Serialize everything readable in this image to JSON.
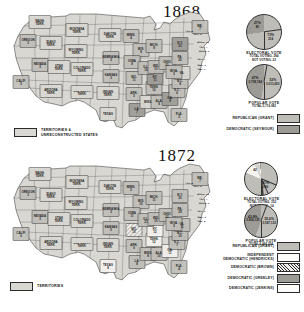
{
  "maps": [
    {
      "year": "1868",
      "territory_legend": {
        "label": "TERRITORIES &\nUNRECONSTRUCTED STATES",
        "swatch": "terr"
      },
      "pies": [
        {
          "caption": "ELECTORAL VOTE",
          "sub": "TOTAL VOTING- 294\nNOT VOTING- 23",
          "slices": [
            {
              "party": "republican",
              "pct": "73%",
              "value": "214",
              "share": 72.8,
              "fill": "rep"
            },
            {
              "party": "democratic",
              "pct": "27%",
              "value": "80",
              "share": 27.2,
              "fill": "dem"
            }
          ]
        },
        {
          "caption": "POPULAR VOTE",
          "sub": "TOTAL 5,716,082",
          "slices": [
            {
              "party": "republican",
              "pct": "53%",
              "value": "3,013,650",
              "share": 52.7,
              "fill": "rep"
            },
            {
              "party": "democratic",
              "pct": "47%",
              "value": "2,708,744",
              "share": 47.3,
              "fill": "dem"
            }
          ]
        }
      ],
      "legend": [
        {
          "label": "REPUBLICAN (GRANT)",
          "swatch": "rep"
        },
        {
          "label": "DEMOCRATIC (SEYMOUR)",
          "swatch": "dem"
        }
      ]
    },
    {
      "year": "1872",
      "territory_legend": {
        "label": "TERRITORIES",
        "swatch": "terr"
      },
      "pies": [
        {
          "caption": "ELECTORAL VOTE",
          "sub": "TOTAL VOTING- 352\nNOT VOTING- 14",
          "slices": [
            {
              "party": "republican",
              "pct": "81%",
              "value": "286",
              "share": 81.3,
              "fill": "rep"
            },
            {
              "party": "hendricks",
              "pct": "",
              "value": "42",
              "share": 11.9,
              "fill": "white"
            },
            {
              "party": "brown",
              "pct": "",
              "value": "18",
              "share": 5.1,
              "fill": "hatch"
            },
            {
              "party": "jenkins",
              "pct": "",
              "value": "2",
              "share": 0.9,
              "fill": "white"
            },
            {
              "party": "davis",
              "pct": "",
              "value": "1",
              "share": 0.8,
              "fill": "dem"
            }
          ]
        },
        {
          "caption": "POPULAR VOTE",
          "sub": "TOTAL 6,466,224",
          "slices": [
            {
              "party": "republican",
              "pct": "55.6%",
              "value": "3,597,132",
              "share": 55.6,
              "fill": "rep"
            },
            {
              "party": "democratic",
              "pct": "43.8%",
              "value": "2,834,125",
              "share": 44.4,
              "fill": "dem"
            }
          ]
        }
      ],
      "legend": [
        {
          "label": "REPUBLICAN (GRANT)",
          "swatch": "rep"
        },
        {
          "label": "INDEPENDENT\nDEMOCRATIC (HENDRICKS)",
          "swatch": "white"
        },
        {
          "label": "DEMOCRATIC (BROWN)",
          "swatch": "hatch"
        },
        {
          "label": "DEMOCRATIC (GREELEY)",
          "swatch": "dem"
        },
        {
          "label": "DEMOCRATIC (JENKINS)",
          "swatch": "white"
        }
      ]
    }
  ],
  "states_1868": [
    {
      "n": "WASH.\nTERR.",
      "x": 36,
      "y": 12,
      "f": "terr"
    },
    {
      "n": "OREGON",
      "e": "3",
      "x": 24,
      "y": 31,
      "f": "rep"
    },
    {
      "n": "IDAHO\nTERR.",
      "x": 47,
      "y": 33,
      "f": "terr"
    },
    {
      "n": "MONTANA\nTERR.",
      "x": 73,
      "y": 20,
      "f": "terr"
    },
    {
      "n": "DAKOTA\nTERR.",
      "x": 106,
      "y": 25,
      "f": "terr"
    },
    {
      "n": "WYOMING\nTERR.",
      "x": 72,
      "y": 41,
      "f": "terr"
    },
    {
      "n": "NEVADA",
      "e": "3",
      "x": 36,
      "y": 55,
      "f": "rep"
    },
    {
      "n": "UTAH\nTERR.",
      "x": 55,
      "y": 57,
      "f": "terr"
    },
    {
      "n": "COLORADO\nTERR.",
      "x": 78,
      "y": 59,
      "f": "terr"
    },
    {
      "n": "NEBRASKA",
      "e": "3",
      "x": 107,
      "y": 48,
      "f": "rep"
    },
    {
      "n": "CALIF.",
      "e": "5",
      "x": 17,
      "y": 72,
      "f": "rep"
    },
    {
      "n": "KANSAS",
      "e": "3",
      "x": 107,
      "y": 66,
      "f": "rep"
    },
    {
      "n": "ARIZONA\nTERR.",
      "x": 47,
      "y": 81,
      "f": "terr"
    },
    {
      "n": "NEW MEXICO\nTERR.",
      "x": 78,
      "y": 82,
      "f": "terr"
    },
    {
      "n": "INDIAN\nTERR.",
      "x": 104,
      "y": 83,
      "f": "terr"
    },
    {
      "n": "TEXAS",
      "x": 104,
      "y": 104,
      "f": "terr"
    },
    {
      "n": "MINN.",
      "e": "4",
      "x": 127,
      "y": 26,
      "f": "rep"
    },
    {
      "n": "WIS.",
      "e": "8",
      "x": 137,
      "y": 40,
      "f": "rep"
    },
    {
      "n": "IOWA",
      "e": "8",
      "x": 128,
      "y": 52,
      "f": "rep"
    },
    {
      "n": "MO.",
      "e": "11",
      "x": 130,
      "y": 68,
      "f": "rep"
    },
    {
      "n": "ARK.",
      "e": "5",
      "x": 130,
      "y": 84,
      "f": "rep"
    },
    {
      "n": "LA.",
      "e": "7",
      "x": 133,
      "y": 100,
      "f": "dem"
    },
    {
      "n": "MISS.",
      "x": 144,
      "y": 92,
      "f": "terr"
    },
    {
      "n": "ALA.",
      "e": "8",
      "x": 155,
      "y": 92,
      "f": "rep"
    },
    {
      "n": "TENN.",
      "e": "10",
      "x": 150,
      "y": 78,
      "f": "rep"
    },
    {
      "n": "KY.",
      "e": "11",
      "x": 151,
      "y": 68,
      "f": "dem"
    },
    {
      "n": "ILL.",
      "e": "16",
      "x": 142,
      "y": 58,
      "f": "rep"
    },
    {
      "n": "IND.",
      "e": "13",
      "x": 152,
      "y": 57,
      "f": "rep"
    },
    {
      "n": "OHIO",
      "e": "21",
      "x": 163,
      "y": 53,
      "f": "rep"
    },
    {
      "n": "MICH.",
      "e": "8",
      "x": 150,
      "y": 36,
      "f": "rep"
    },
    {
      "n": "GA.",
      "e": "9",
      "x": 166,
      "y": 89,
      "f": "dem"
    },
    {
      "n": "FLA.",
      "e": "3",
      "x": 175,
      "y": 105,
      "f": "rep"
    },
    {
      "n": "S.C.",
      "e": "6",
      "x": 173,
      "y": 81,
      "f": "rep"
    },
    {
      "n": "N.C.",
      "e": "9",
      "x": 176,
      "y": 72,
      "f": "rep"
    },
    {
      "n": "VA.",
      "x": 178,
      "y": 63,
      "f": "terr"
    },
    {
      "n": "W.VA.",
      "e": "5",
      "x": 170,
      "y": 62,
      "f": "rep"
    },
    {
      "n": "PA.",
      "e": "26",
      "x": 176,
      "y": 48,
      "f": "rep"
    },
    {
      "n": "N.Y.",
      "e": "33",
      "x": 176,
      "y": 34,
      "f": "dem"
    },
    {
      "n": "ME.",
      "e": "7",
      "x": 196,
      "y": 17,
      "f": "rep"
    }
  ],
  "small_states_1868": [
    {
      "n": "VT. 5",
      "x": 186,
      "y": 22
    },
    {
      "n": "N.H. 5",
      "x": 194,
      "y": 25
    },
    {
      "n": "MASS. 12",
      "x": 199,
      "y": 33
    },
    {
      "n": "R.I. 4",
      "x": 200,
      "y": 38
    },
    {
      "n": "CONN. 6",
      "x": 200,
      "y": 42
    },
    {
      "n": "N.J. 7",
      "x": 198,
      "y": 50
    },
    {
      "n": "DEL. 3",
      "x": 198,
      "y": 56
    },
    {
      "n": "MD. 7",
      "x": 198,
      "y": 60
    }
  ],
  "states_1872": [
    {
      "n": "WASH.\nTERR.",
      "x": 36,
      "y": 12,
      "f": "terr"
    },
    {
      "n": "OREGON",
      "e": "3",
      "x": 24,
      "y": 31,
      "f": "rep"
    },
    {
      "n": "IDAHO\nTERR.",
      "x": 47,
      "y": 33,
      "f": "terr"
    },
    {
      "n": "MONTANA\nTERR.",
      "x": 73,
      "y": 20,
      "f": "terr"
    },
    {
      "n": "DAKOTA\nTERR.",
      "x": 106,
      "y": 25,
      "f": "terr"
    },
    {
      "n": "WYOMING\nTERR.",
      "x": 72,
      "y": 41,
      "f": "terr"
    },
    {
      "n": "NEVADA",
      "e": "3",
      "x": 36,
      "y": 55,
      "f": "rep"
    },
    {
      "n": "UTAH\nTERR.",
      "x": 55,
      "y": 57,
      "f": "terr"
    },
    {
      "n": "COLORADO\nTERR.",
      "x": 78,
      "y": 59,
      "f": "terr"
    },
    {
      "n": "NEBRASKA",
      "e": "3",
      "x": 107,
      "y": 48,
      "f": "rep"
    },
    {
      "n": "CALIF.",
      "e": "6",
      "x": 17,
      "y": 72,
      "f": "rep"
    },
    {
      "n": "KANSAS",
      "e": "5",
      "x": 107,
      "y": 66,
      "f": "rep"
    },
    {
      "n": "ARIZONA\nTERR.",
      "x": 47,
      "y": 81,
      "f": "terr"
    },
    {
      "n": "NEW MEXICO\nTERR.",
      "x": 78,
      "y": 82,
      "f": "terr"
    },
    {
      "n": "INDIAN\nTERR.",
      "x": 104,
      "y": 83,
      "f": "terr"
    },
    {
      "n": "TEXAS",
      "e": "8",
      "x": 104,
      "y": 104,
      "f": "white"
    },
    {
      "n": "MINN.",
      "e": "5",
      "x": 127,
      "y": 26,
      "f": "rep"
    },
    {
      "n": "WIS.",
      "e": "10",
      "x": 137,
      "y": 40,
      "f": "rep"
    },
    {
      "n": "IOWA",
      "e": "11",
      "x": 128,
      "y": 52,
      "f": "rep"
    },
    {
      "n": "MO.",
      "e": "15",
      "x": 130,
      "y": 68,
      "f": "hatch"
    },
    {
      "n": "ARK.",
      "e": "6",
      "x": 130,
      "y": 84,
      "f": "rep"
    },
    {
      "n": "LA.",
      "e": "8",
      "x": 133,
      "y": 100,
      "f": "rep"
    },
    {
      "n": "MISS.",
      "e": "8",
      "x": 144,
      "y": 92,
      "f": "rep"
    },
    {
      "n": "ALA.",
      "e": "10",
      "x": 155,
      "y": 92,
      "f": "rep"
    },
    {
      "n": "TENN.",
      "e": "12",
      "x": 150,
      "y": 78,
      "f": "white"
    },
    {
      "n": "KY.",
      "e": "12",
      "x": 151,
      "y": 68,
      "f": "white"
    },
    {
      "n": "ILL.",
      "e": "21",
      "x": 142,
      "y": 58,
      "f": "rep"
    },
    {
      "n": "IND.",
      "e": "15",
      "x": 152,
      "y": 57,
      "f": "rep"
    },
    {
      "n": "OHIO",
      "e": "22",
      "x": 163,
      "y": 53,
      "f": "rep"
    },
    {
      "n": "MICH.",
      "e": "11",
      "x": 150,
      "y": 36,
      "f": "rep"
    },
    {
      "n": "GA.",
      "e": "11",
      "x": 166,
      "y": 89,
      "f": "white"
    },
    {
      "n": "FLA.",
      "e": "4",
      "x": 175,
      "y": 105,
      "f": "rep"
    },
    {
      "n": "S.C.",
      "e": "7",
      "x": 173,
      "y": 81,
      "f": "rep"
    },
    {
      "n": "N.C.",
      "e": "10",
      "x": 176,
      "y": 72,
      "f": "rep"
    },
    {
      "n": "VA.",
      "e": "11",
      "x": 178,
      "y": 63,
      "f": "rep"
    },
    {
      "n": "W.VA.",
      "e": "5",
      "x": 170,
      "y": 62,
      "f": "rep"
    },
    {
      "n": "PA.",
      "e": "29",
      "x": 176,
      "y": 48,
      "f": "rep"
    },
    {
      "n": "N.Y.",
      "e": "35",
      "x": 176,
      "y": 34,
      "f": "rep"
    },
    {
      "n": "ME.",
      "e": "7",
      "x": 196,
      "y": 17,
      "f": "rep"
    }
  ],
  "small_states_1872": [
    {
      "n": "VT. 5",
      "x": 186,
      "y": 22
    },
    {
      "n": "N.H. 5",
      "x": 194,
      "y": 25
    },
    {
      "n": "MASS. 13",
      "x": 199,
      "y": 33
    },
    {
      "n": "R.I. 4",
      "x": 200,
      "y": 38
    },
    {
      "n": "CONN. 6",
      "x": 200,
      "y": 42
    },
    {
      "n": "N.J. 9",
      "x": 198,
      "y": 50
    },
    {
      "n": "DEL. 3",
      "x": 198,
      "y": 56
    },
    {
      "n": "MD. 8",
      "x": 198,
      "y": 60
    }
  ],
  "colors": {
    "territory": "#d9d7d2",
    "republican": "#bfbdb8",
    "democratic": "#9d9b96",
    "white": "#f3f2ef",
    "outline": "#2b2b2b"
  }
}
